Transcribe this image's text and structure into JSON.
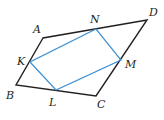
{
  "figure": {
    "outer": {
      "name": "ABCD",
      "color": "#231f20",
      "vertices": [
        {
          "label": "A",
          "x": 43,
          "y": 38,
          "lx": 33,
          "ly": 33
        },
        {
          "label": "B",
          "x": 16,
          "y": 85,
          "lx": 6,
          "ly": 99
        },
        {
          "label": "C",
          "x": 96,
          "y": 96,
          "lx": 97,
          "ly": 108
        },
        {
          "label": "D",
          "x": 147,
          "y": 20,
          "lx": 149,
          "ly": 16
        }
      ]
    },
    "inner": {
      "name": "KLMN",
      "color": "#3d8fd1",
      "vertices": [
        {
          "label": "K",
          "x": 30,
          "y": 62,
          "lx": 17,
          "ly": 65
        },
        {
          "label": "L",
          "x": 56,
          "y": 90,
          "lx": 49,
          "ly": 106
        },
        {
          "label": "M",
          "x": 121,
          "y": 60,
          "lx": 125,
          "ly": 68
        },
        {
          "label": "N",
          "x": 96,
          "y": 29,
          "lx": 90,
          "ly": 23
        }
      ]
    }
  }
}
